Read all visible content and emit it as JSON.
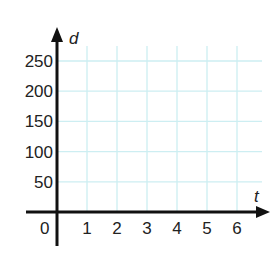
{
  "chart_data": {
    "type": "line",
    "title": "",
    "xlabel": "t",
    "ylabel": "d",
    "x_ticks": [
      1,
      2,
      3,
      4,
      5,
      6
    ],
    "y_ticks": [
      50,
      100,
      150,
      200,
      250
    ],
    "origin_label": "0",
    "xlim": [
      0,
      7
    ],
    "ylim": [
      0,
      280
    ],
    "grid": true,
    "grid_color": "#cdeef2",
    "axis_color": "#111111",
    "series": []
  }
}
